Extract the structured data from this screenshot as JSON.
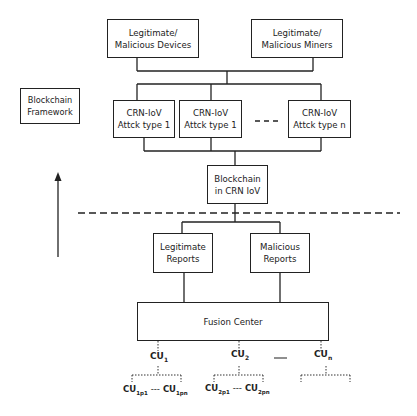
{
  "diagram": {
    "top_nodes": [
      {
        "id": "devices",
        "line1": "Legitimate/",
        "line2": "Malicious Devices"
      },
      {
        "id": "miners",
        "line1": "Legitimate/",
        "line2": "Malicious Miners"
      }
    ],
    "attack_nodes": [
      {
        "line1": "CRN-IoV",
        "line2": "Attck type 1"
      },
      {
        "line1": "CRN-IoV",
        "line2": "Attck type 1"
      },
      {
        "line1": "CRN-IoV",
        "line2": "Attck type n"
      }
    ],
    "attack_ellipsis": "- - -",
    "framework_label": {
      "line1": "Blockchain",
      "line2": "Framework"
    },
    "blockchain_node": {
      "line1": "Blockchain",
      "line2": "in CRN IoV"
    },
    "report_nodes": [
      {
        "line1": "Legitimate",
        "line2": "Reports"
      },
      {
        "line1": "Malicious",
        "line2": "Reports"
      }
    ],
    "fusion_center": "Fusion Center",
    "cu_nodes": [
      {
        "base": "CU",
        "sub": "1"
      },
      {
        "base": "CU",
        "sub": "2"
      },
      {
        "base": "CU",
        "sub": "n"
      }
    ],
    "cu_ellipsis": "---",
    "cu_children": [
      {
        "first": {
          "base": "CU",
          "sub": "1p1"
        },
        "sep": "---",
        "last": {
          "base": "CU",
          "sub": "1pn"
        }
      },
      {
        "first": {
          "base": "CU",
          "sub": "2p1"
        },
        "sep": "---",
        "last": {
          "base": "CU",
          "sub": "2pn"
        }
      }
    ],
    "colors": {
      "line": "#222222",
      "background": "#ffffff"
    }
  }
}
